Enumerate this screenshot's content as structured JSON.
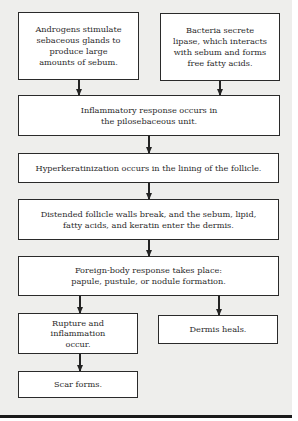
{
  "diagram": {
    "type": "flowchart",
    "nodes": [
      {
        "id": "androgens",
        "label": "Androgens stimulate sebaceous glands to produce large amounts of sebum."
      },
      {
        "id": "bacteria",
        "label": "Bacteria secrete lipase, which interacts with sebum and forms free fatty acids."
      },
      {
        "id": "inflammatory",
        "label": "Inflammatory response occurs in the pilosebaceous unit."
      },
      {
        "id": "hyperkeratinization",
        "label": "Hyperkeratinization occurs in the lining of the follicle."
      },
      {
        "id": "distended",
        "label": "Distended follicle walls break, and the sebum, lipid, fatty acids, and keratin enter the dermis."
      },
      {
        "id": "foreign-body",
        "label": "Foreign-body response takes place: papule, pustule, or nodule formation."
      },
      {
        "id": "rupture",
        "label": "Rupture and inflammation occur."
      },
      {
        "id": "dermis-heals",
        "label": "Dermis heals."
      },
      {
        "id": "scar",
        "label": "Scar forms."
      }
    ],
    "edges": [
      {
        "from": "androgens",
        "to": "inflammatory"
      },
      {
        "from": "bacteria",
        "to": "inflammatory"
      },
      {
        "from": "inflammatory",
        "to": "hyperkeratinization"
      },
      {
        "from": "hyperkeratinization",
        "to": "distended"
      },
      {
        "from": "distended",
        "to": "foreign-body"
      },
      {
        "from": "foreign-body",
        "to": "rupture"
      },
      {
        "from": "foreign-body",
        "to": "dermis-heals"
      },
      {
        "from": "rupture",
        "to": "scar"
      }
    ]
  },
  "labels": {
    "androgens": "Androgens stimulate sebaceous glands to produce large amounts of sebum.",
    "bacteria": "Bacteria secrete lipase, which interacts with sebum and forms free fatty acids.",
    "inflammatory": "Inflammatory response occurs in the pilosebaceous unit.",
    "hyperkeratinization": "Hyperkeratinization occurs in the lining of the follicle.",
    "distended": "Distended follicle walls break, and the sebum, lipid, fatty acids, and keratin enter the dermis.",
    "foreign_body": "Foreign-body response takes place: papule, pustule, or nodule formation.",
    "rupture": "Rupture and inflammation occur.",
    "dermis_heals": "Dermis heals.",
    "scar": "Scar forms."
  }
}
